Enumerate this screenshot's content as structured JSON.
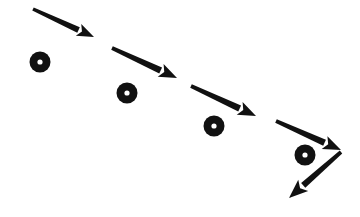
{
  "figure": {
    "background_color": "#ffffff",
    "ink_color": "#111111",
    "width": 360,
    "height": 217,
    "style": "monochrome line drawing"
  },
  "arrows": [
    {
      "name": "arrow-1",
      "label": "first descending arrow",
      "x1": 33,
      "y1": 9,
      "x2": 94,
      "y2": 37,
      "shaft_width": 4.2,
      "head_length": 17,
      "head_width": 13,
      "color": "#111111"
    },
    {
      "name": "arrow-2",
      "label": "second descending arrow",
      "x1": 112,
      "y1": 48,
      "x2": 177,
      "y2": 78,
      "shaft_width": 4.6,
      "head_length": 18,
      "head_width": 14,
      "color": "#111111"
    },
    {
      "name": "arrow-3",
      "label": "third descending arrow",
      "x1": 191,
      "y1": 86,
      "x2": 256,
      "y2": 116,
      "shaft_width": 4.6,
      "head_length": 18,
      "head_width": 14,
      "color": "#111111"
    },
    {
      "name": "arrow-4",
      "label": "fourth descending arrow",
      "x1": 276,
      "y1": 121,
      "x2": 341,
      "y2": 150,
      "shaft_width": 4.6,
      "head_length": 18,
      "head_width": 14,
      "color": "#111111"
    },
    {
      "name": "arrow-5",
      "label": "final arrow reversing down-left",
      "x1": 341,
      "y1": 152,
      "x2": 289,
      "y2": 198,
      "shaft_width": 4.4,
      "head_length": 19,
      "head_width": 15,
      "color": "#111111"
    }
  ],
  "markers": [
    {
      "name": "ring-marker-1",
      "label": "first ring marker",
      "cx": 40,
      "cy": 62,
      "outer_radius": 10.5,
      "inner_radius": 2.6,
      "fill": "#111111",
      "hole_fill": "#ffffff"
    },
    {
      "name": "ring-marker-2",
      "label": "second ring marker",
      "cx": 127,
      "cy": 93,
      "outer_radius": 10.5,
      "inner_radius": 2.6,
      "fill": "#111111",
      "hole_fill": "#ffffff"
    },
    {
      "name": "ring-marker-3",
      "label": "third ring marker",
      "cx": 214,
      "cy": 126,
      "outer_radius": 10.5,
      "inner_radius": 2.6,
      "fill": "#111111",
      "hole_fill": "#ffffff"
    },
    {
      "name": "ring-marker-4",
      "label": "fourth ring marker",
      "cx": 305,
      "cy": 155,
      "outer_radius": 10.5,
      "inner_radius": 2.6,
      "fill": "#111111",
      "hole_fill": "#ffffff"
    }
  ]
}
